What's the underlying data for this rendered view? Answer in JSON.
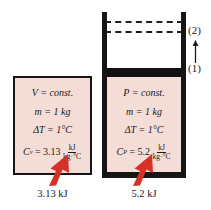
{
  "figure": {
    "colors": {
      "gas_fill": "#f4ddd7",
      "wall": "#151515",
      "heat_arrow": "#d63128",
      "background": "#ffffff"
    }
  },
  "constant_volume": {
    "container_type": "rigid-tank",
    "lines": {
      "process": "V = const.",
      "mass": "m = 1 kg",
      "delta_t": "ΔT = 1°C"
    },
    "specific_heat": {
      "symbol": "C",
      "subscript": "v",
      "equals": "=",
      "value": "3.13",
      "numerator": "kJ",
      "denominator": "kg·°C"
    },
    "caption": "3.13 kJ"
  },
  "constant_pressure": {
    "container_type": "piston-cylinder",
    "lines": {
      "process": "P = const.",
      "mass": "m = 1 kg",
      "delta_t": "ΔT = 1°C"
    },
    "specific_heat": {
      "symbol": "C",
      "subscript": "P",
      "equals": "=",
      "value": "5.2",
      "numerator": "kJ",
      "denominator": "kg·°C"
    },
    "caption": "5.2 kJ",
    "state_labels": {
      "initial": "(1)",
      "final": "(2)"
    }
  }
}
